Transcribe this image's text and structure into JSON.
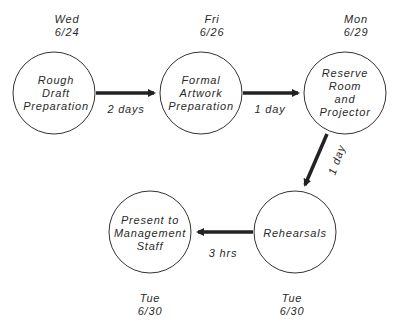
{
  "nodes": [
    {
      "id": "rough-draft",
      "lines": [
        "Rough",
        "Draft",
        "Preparation"
      ],
      "day": "Wed",
      "date": "6/24"
    },
    {
      "id": "formal-artwork",
      "lines": [
        "Formal",
        "Artwork",
        "Preparation"
      ],
      "day": "Fri",
      "date": "6/26"
    },
    {
      "id": "reserve-room",
      "lines": [
        "Reserve",
        "Room and",
        "Projector"
      ],
      "day": "Mon",
      "date": "6/29"
    },
    {
      "id": "rehearsals",
      "lines": [
        "Rehearsals"
      ],
      "day": "Tue",
      "date": "6/30"
    },
    {
      "id": "present",
      "lines": [
        "Present to",
        "Management",
        "Staff"
      ],
      "day": "Tue",
      "date": "6/30"
    }
  ],
  "edges": [
    {
      "from": "rough-draft",
      "to": "formal-artwork",
      "duration": "2 days"
    },
    {
      "from": "formal-artwork",
      "to": "reserve-room",
      "duration": "1 day"
    },
    {
      "from": "reserve-room",
      "to": "rehearsals",
      "duration": "1 day"
    },
    {
      "from": "rehearsals",
      "to": "present",
      "duration": "3 hrs"
    }
  ],
  "colors": {
    "line": "#222222",
    "text": "#2a2a2a",
    "background": "#ffffff"
  }
}
